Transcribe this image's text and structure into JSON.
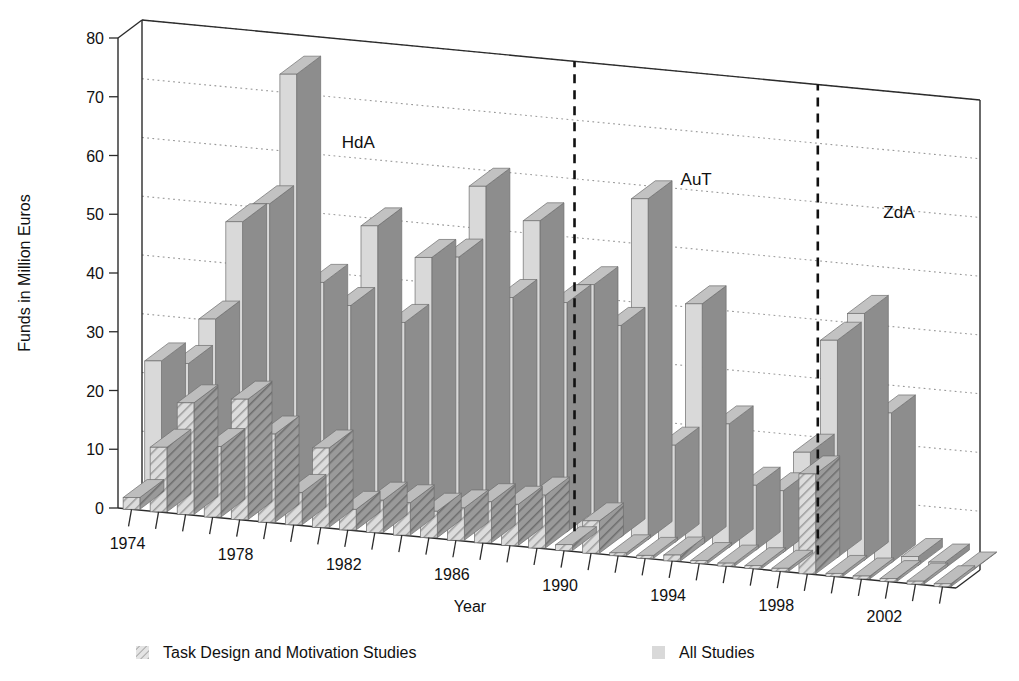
{
  "chart_data": {
    "type": "bar",
    "title": "",
    "xlabel": "Year",
    "ylabel": "Funds in Million Euros",
    "ylim": [
      0,
      80
    ],
    "ytick_step": 10,
    "yticks": [
      0,
      10,
      20,
      30,
      40,
      50,
      60,
      70,
      80
    ],
    "grid": true,
    "grid_axis": "y",
    "projection": "3d",
    "legend_position": "bottom",
    "categories": [
      1974,
      1975,
      1976,
      1977,
      1978,
      1979,
      1980,
      1981,
      1982,
      1983,
      1984,
      1985,
      1986,
      1987,
      1988,
      1989,
      1990,
      1991,
      1992,
      1993,
      1994,
      1995,
      1996,
      1997,
      1998,
      1999,
      2000,
      2001,
      2002,
      2003,
      2004
    ],
    "xtick_labels": [
      "1974",
      "1978",
      "1982",
      "1986",
      "1990",
      "1994",
      "1998",
      "2002"
    ],
    "xtick_label_years": [
      1974,
      1978,
      1982,
      1986,
      1990,
      1994,
      1998,
      2002
    ],
    "series": [
      {
        "name": "All Studies",
        "key": "all_studies",
        "fill": "#d9d9d9",
        "side": "#8d8d8d",
        "top": "#c2c2c2",
        "pattern": "solid",
        "values": [
          22.5,
          22.5,
          30.5,
          47.5,
          51.0,
          73.5,
          38.5,
          35.0,
          49.0,
          33.0,
          44.5,
          45.0,
          57.5,
          39.0,
          52.5,
          39.0,
          42.5,
          36.0,
          58.0,
          16.5,
          41.0,
          21.0,
          11.0,
          10.5,
          17.5,
          37.0,
          42.0,
          25.5,
          1.5,
          1.0,
          0.0
        ]
      },
      {
        "name": "Task Design and Motivation Studies",
        "key": "task_design",
        "fill": "#d4d4d4",
        "side": "#8d8d8d",
        "top": "#bfbfbf",
        "pattern": "hatch",
        "values": [
          2.0,
          11.0,
          19.0,
          12.0,
          20.5,
          15.0,
          5.5,
          13.5,
          3.5,
          5.5,
          5.5,
          4.5,
          5.5,
          7.0,
          7.0,
          9.0,
          1.0,
          5.5,
          0.5,
          0.5,
          1.0,
          0.5,
          0.5,
          0.5,
          0.5,
          17.0,
          0.5,
          0.5,
          0.5,
          0.5,
          0.5
        ]
      }
    ],
    "eras": [
      {
        "label": "HdA",
        "start_year": 1974,
        "end_year": 1989
      },
      {
        "label": "AuT",
        "start_year": 1990,
        "end_year": 1998
      },
      {
        "label": "ZdA",
        "start_year": 1999,
        "end_year": 2004
      }
    ],
    "dividers": [
      {
        "after_year": 1989,
        "style": "dashed"
      },
      {
        "after_year": 1998,
        "style": "dashed"
      }
    ]
  },
  "legend": {
    "items": [
      {
        "label": "Task Design and Motivation Studies",
        "pattern": "hatch"
      },
      {
        "label": "All Studies",
        "pattern": "solid"
      }
    ]
  }
}
